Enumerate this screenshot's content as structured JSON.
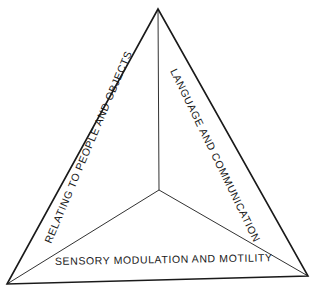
{
  "diagram": {
    "type": "triangle",
    "colors": {
      "stroke": "#1a1a1a",
      "background": "#ffffff"
    },
    "vertices": {
      "top": [
        158,
        9
      ],
      "bottom_left": [
        7,
        284
      ],
      "bottom_right": [
        308,
        276
      ],
      "center": [
        159,
        190
      ]
    },
    "labels": {
      "left": "RELATING TO PEOPLE AND OBJECTS",
      "right": "LANGUAGE AND COMMUNICATION",
      "bottom": "SENSORY MODULATION AND MOTILITY"
    }
  }
}
